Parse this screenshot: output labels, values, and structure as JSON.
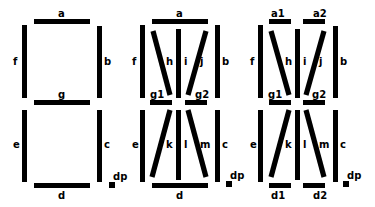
{
  "diagram": {
    "type": "segment-display-comparison",
    "displays": [
      {
        "name": "7-segment",
        "segments": [
          "a",
          "b",
          "c",
          "d",
          "e",
          "f",
          "g",
          "dp"
        ]
      },
      {
        "name": "14-segment",
        "segments": [
          "a",
          "b",
          "c",
          "d",
          "e",
          "f",
          "g1",
          "g2",
          "h",
          "i",
          "j",
          "k",
          "l",
          "m",
          "dp"
        ]
      },
      {
        "name": "16-segment",
        "segments": [
          "a1",
          "a2",
          "b",
          "c",
          "d1",
          "d2",
          "e",
          "f",
          "g1",
          "g2",
          "h",
          "i",
          "j",
          "k",
          "l",
          "m",
          "dp"
        ]
      }
    ]
  },
  "labels": {
    "seven": {
      "a": "a",
      "b": "b",
      "c": "c",
      "d": "d",
      "e": "e",
      "f": "f",
      "g": "g",
      "dp": "dp"
    },
    "fourteen": {
      "a": "a",
      "b": "b",
      "c": "c",
      "d": "d",
      "e": "e",
      "f": "f",
      "g1": "g1",
      "g2": "g2",
      "h": "h",
      "i": "i",
      "j": "j",
      "k": "k",
      "l": "l",
      "m": "m",
      "dp": "dp"
    },
    "sixteen": {
      "a1": "a1",
      "a2": "a2",
      "b": "b",
      "c": "c",
      "d1": "d1",
      "d2": "d2",
      "e": "e",
      "f": "f",
      "g1": "g1",
      "g2": "g2",
      "h": "h",
      "i": "i",
      "j": "j",
      "k": "k",
      "l": "l",
      "m": "m",
      "dp": "dp"
    }
  },
  "colors": {
    "segment": "#000000",
    "background": "#ffffff"
  }
}
